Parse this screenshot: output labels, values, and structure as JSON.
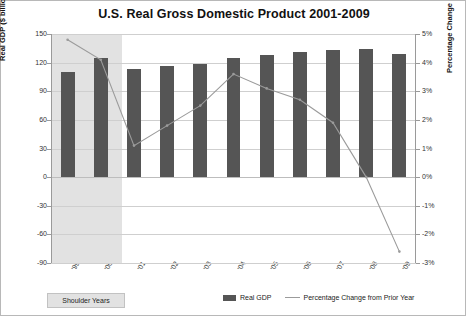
{
  "chart_data": {
    "type": "bar",
    "title": "U.S. Real Gross Domestic Product 2001-2009",
    "xlabel": "",
    "ylabel": "Real GDP ($ billions, in 2005 dollars)",
    "y2label": "Percentage Change",
    "categories": [
      "'99",
      "'00",
      "'01",
      "'02",
      "'03",
      "'04",
      "'05",
      "'06",
      "'07",
      "'08",
      "'09"
    ],
    "ylim": [
      -90,
      150
    ],
    "yticks": [
      "150",
      "120",
      "90",
      "60",
      "30",
      "0",
      "-30",
      "-60",
      "-90"
    ],
    "y2lim": [
      -3,
      5
    ],
    "y2ticks": [
      "5%",
      "4%",
      "3%",
      "2%",
      "1%",
      "0%",
      "-1%",
      "-2%",
      "-3%"
    ],
    "grid": true,
    "legend_position": "bottom",
    "series": [
      {
        "name": "Real GDP",
        "type": "bar",
        "axis": "left",
        "color": "#555555",
        "values": [
          110,
          125,
          113,
          116,
          119,
          125,
          128,
          131,
          133,
          134,
          129
        ]
      },
      {
        "name": "Percentage Change from Prior Year",
        "type": "line",
        "axis": "right",
        "color": "#9b9b9b",
        "values": [
          4.8,
          4.1,
          1.1,
          1.8,
          2.5,
          3.6,
          3.1,
          2.7,
          1.9,
          0.0,
          -2.6
        ]
      }
    ],
    "annotations": [
      {
        "name": "shoulder-years-band",
        "label": "Shoulder Years",
        "covers": [
          "'99",
          "'00"
        ]
      }
    ]
  },
  "legend": {
    "items": [
      {
        "label": "Real GDP",
        "swatch": "bar-swatch"
      },
      {
        "label": "Percentage Change from Prior Year",
        "swatch": "line-swatch"
      }
    ]
  },
  "shoulder": {
    "label": "Shoulder Years"
  }
}
